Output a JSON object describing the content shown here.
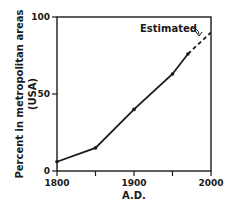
{
  "chart_data": {
    "type": "line",
    "title": "",
    "xlabel": "A.D.",
    "ylabel": "Percent in metropolitan areas (USA)",
    "ylabel_lines": [
      "Percent in metropolitan areas",
      "(USA)"
    ],
    "xlim": [
      1800,
      2000
    ],
    "ylim": [
      0,
      100
    ],
    "x_ticks": [
      1800,
      1850,
      1900,
      1950,
      2000
    ],
    "x_tick_labels": [
      "1800",
      "",
      "1900",
      "",
      "2000"
    ],
    "y_ticks": [
      0,
      50,
      100
    ],
    "y_tick_labels": [
      "0",
      "50",
      "100"
    ],
    "grid": false,
    "series": [
      {
        "name": "Observed",
        "style": "solid",
        "x": [
          1800,
          1850,
          1900,
          1950,
          1970
        ],
        "y": [
          6,
          15,
          40,
          63,
          76
        ]
      },
      {
        "name": "Estimated",
        "style": "dashed",
        "x": [
          1970,
          2000
        ],
        "y": [
          76,
          90
        ]
      }
    ],
    "annotations": [
      {
        "text": "Estimated",
        "points_to": [
          1990,
          85
        ]
      }
    ]
  }
}
